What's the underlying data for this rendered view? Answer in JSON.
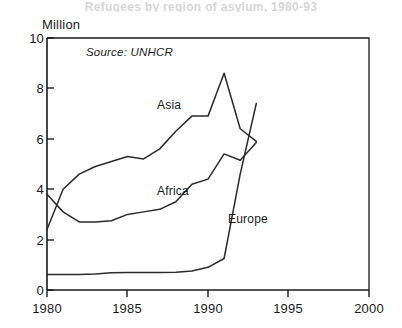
{
  "title_faint": "Refugees by region of asylum, 1980-93",
  "unit_label": "Million",
  "source_note": "Source: UNHCR",
  "labels": {
    "asia": "Asia",
    "africa": "Africa",
    "europe": "Europe"
  },
  "colors": {
    "line": "#2b2b2b",
    "axis": "#1a1a1a",
    "background": "#ffffff"
  },
  "axis": {
    "y_ticks": [
      "0",
      "2",
      "4",
      "6",
      "8",
      "10"
    ],
    "x_ticks": [
      "1980",
      "1985",
      "1990",
      "1995",
      "2000"
    ]
  },
  "chart_data": {
    "type": "line",
    "title": "Refugees by region of asylum, 1980-93",
    "xlabel": "",
    "ylabel": "Million",
    "xlim": [
      1980,
      2000
    ],
    "ylim": [
      0,
      10
    ],
    "grid": false,
    "legend": "inline-annotations",
    "annotations": [
      "Source: UNHCR"
    ],
    "x": [
      1980,
      1981,
      1982,
      1983,
      1984,
      1985,
      1986,
      1987,
      1988,
      1989,
      1990,
      1991,
      1992,
      1993
    ],
    "series": [
      {
        "name": "Asia",
        "values": [
          2.4,
          4.0,
          4.6,
          4.9,
          5.1,
          5.3,
          5.2,
          5.6,
          6.3,
          6.9,
          6.9,
          8.6,
          6.4,
          5.9
        ]
      },
      {
        "name": "Africa",
        "values": [
          3.8,
          3.1,
          2.7,
          2.7,
          2.75,
          3.0,
          3.1,
          3.2,
          3.5,
          4.2,
          4.4,
          5.4,
          5.15,
          5.85
        ]
      },
      {
        "name": "Europe",
        "values": [
          0.62,
          0.62,
          0.62,
          0.63,
          0.68,
          0.69,
          0.69,
          0.69,
          0.7,
          0.75,
          0.9,
          1.25,
          4.6,
          7.4
        ]
      }
    ]
  }
}
